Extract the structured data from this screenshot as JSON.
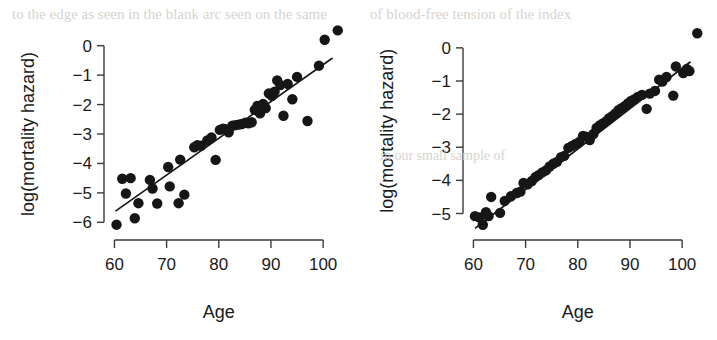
{
  "figure": {
    "background": "#ffffff",
    "ink_color": "#161616",
    "panel_count": 2
  },
  "ghost_artifacts": [
    {
      "text": "to the edge as seen in the blank arc seen on the same",
      "x": 12,
      "y": 6,
      "size": 15
    },
    {
      "text": "of blood-free tension of the index",
      "x": 370,
      "y": 6,
      "size": 15
    },
    {
      "text": "in our small sample of",
      "x": 380,
      "y": 148,
      "size": 14
    }
  ],
  "chart_data": [
    {
      "id": "left-panel",
      "type": "scatter",
      "title": "",
      "xlabel": "Age",
      "ylabel": "log(mortality hazard)",
      "xlim": [
        58,
        104
      ],
      "ylim": [
        -6.6,
        0.6
      ],
      "xticks": [
        60,
        70,
        80,
        90,
        100
      ],
      "xtick_labels": [
        "60",
        "70",
        "80",
        "90",
        "100"
      ],
      "yticks": [
        0,
        -1,
        -2,
        -3,
        -4,
        -5,
        -6
      ],
      "ytick_labels": [
        "0",
        "-1",
        "-2",
        "-3",
        "-4",
        "-5",
        "-6"
      ],
      "grid": false,
      "legend": "none",
      "marker": "filled-circle",
      "marker_size": 5.2,
      "fit_line": {
        "x_start": 60.2,
        "y_start": -5.62,
        "x_end": 101.8,
        "y_end": -0.42
      },
      "points": [
        [
          60.4,
          -6.08
        ],
        [
          61.5,
          -4.52
        ],
        [
          62.2,
          -5.02
        ],
        [
          63.1,
          -4.5
        ],
        [
          63.9,
          -5.86
        ],
        [
          64.6,
          -5.35
        ],
        [
          66.8,
          -4.56
        ],
        [
          67.3,
          -4.85
        ],
        [
          68.2,
          -5.36
        ],
        [
          70.3,
          -4.12
        ],
        [
          70.6,
          -4.78
        ],
        [
          72.3,
          -5.35
        ],
        [
          72.6,
          -3.87
        ],
        [
          73.4,
          -5.06
        ],
        [
          75.3,
          -3.45
        ],
        [
          75.9,
          -3.38
        ],
        [
          76.6,
          -3.4
        ],
        [
          77.8,
          -3.22
        ],
        [
          78.6,
          -3.12
        ],
        [
          79.4,
          -3.88
        ],
        [
          80.2,
          -2.86
        ],
        [
          80.8,
          -2.82
        ],
        [
          81.3,
          -2.84
        ],
        [
          81.9,
          -2.94
        ],
        [
          82.6,
          -2.72
        ],
        [
          83.2,
          -2.7
        ],
        [
          83.8,
          -2.68
        ],
        [
          84.4,
          -2.66
        ],
        [
          85.1,
          -2.62
        ],
        [
          85.7,
          -2.64
        ],
        [
          86.3,
          -2.6
        ],
        [
          86.9,
          -2.18
        ],
        [
          87.4,
          -2.05
        ],
        [
          87.9,
          -2.3
        ],
        [
          88.5,
          -1.98
        ],
        [
          89.0,
          -2.12
        ],
        [
          89.6,
          -1.62
        ],
        [
          90.2,
          -1.7
        ],
        [
          90.7,
          -1.56
        ],
        [
          91.2,
          -1.18
        ],
        [
          91.8,
          -1.34
        ],
        [
          92.4,
          -2.38
        ],
        [
          93.2,
          -1.3
        ],
        [
          94.1,
          -1.82
        ],
        [
          95.0,
          -1.06
        ],
        [
          97.0,
          -2.56
        ],
        [
          99.2,
          -0.68
        ],
        [
          100.3,
          0.2
        ],
        [
          102.8,
          0.52
        ]
      ]
    },
    {
      "id": "right-panel",
      "type": "scatter",
      "title": "",
      "xlabel": "Age",
      "ylabel": "log(mortality hazard)",
      "xlim": [
        58,
        104
      ],
      "ylim": [
        -5.8,
        0.6
      ],
      "xticks": [
        60,
        70,
        80,
        90,
        100
      ],
      "xtick_labels": [
        "60",
        "70",
        "80",
        "90",
        "100"
      ],
      "yticks": [
        0,
        -1,
        -2,
        -3,
        -4,
        -5
      ],
      "ytick_labels": [
        "0",
        "-1",
        "-2",
        "-3",
        "-4",
        "-5"
      ],
      "grid": false,
      "legend": "none",
      "marker": "filled-circle",
      "marker_size": 5.2,
      "fit_line": {
        "x_start": 60.3,
        "y_start": -5.45,
        "x_end": 101.6,
        "y_end": -0.42
      },
      "points": [
        [
          60.3,
          -5.08
        ],
        [
          61.2,
          -5.12
        ],
        [
          61.8,
          -5.34
        ],
        [
          62.4,
          -4.96
        ],
        [
          62.9,
          -5.08
        ],
        [
          63.4,
          -4.5
        ],
        [
          65.1,
          -4.98
        ],
        [
          66.0,
          -4.62
        ],
        [
          67.2,
          -4.48
        ],
        [
          68.3,
          -4.38
        ],
        [
          69.0,
          -4.34
        ],
        [
          69.6,
          -4.08
        ],
        [
          70.4,
          -4.12
        ],
        [
          71.2,
          -4.02
        ],
        [
          71.9,
          -3.9
        ],
        [
          72.5,
          -3.84
        ],
        [
          73.2,
          -3.76
        ],
        [
          73.9,
          -3.7
        ],
        [
          74.6,
          -3.58
        ],
        [
          75.3,
          -3.5
        ],
        [
          76.0,
          -3.44
        ],
        [
          76.8,
          -3.3
        ],
        [
          77.4,
          -3.26
        ],
        [
          78.2,
          -3.02
        ],
        [
          78.9,
          -2.96
        ],
        [
          79.6,
          -2.9
        ],
        [
          80.3,
          -2.84
        ],
        [
          81.0,
          -2.66
        ],
        [
          81.6,
          -2.68
        ],
        [
          82.3,
          -2.78
        ],
        [
          83.0,
          -2.6
        ],
        [
          83.6,
          -2.42
        ],
        [
          84.2,
          -2.34
        ],
        [
          84.8,
          -2.28
        ],
        [
          85.4,
          -2.22
        ],
        [
          86.0,
          -2.12
        ],
        [
          86.6,
          -2.06
        ],
        [
          87.2,
          -1.98
        ],
        [
          87.8,
          -1.88
        ],
        [
          88.4,
          -1.82
        ],
        [
          89.0,
          -1.76
        ],
        [
          89.6,
          -1.68
        ],
        [
          90.2,
          -1.6
        ],
        [
          90.8,
          -1.56
        ],
        [
          91.5,
          -1.48
        ],
        [
          92.3,
          -1.42
        ],
        [
          93.2,
          -1.84
        ],
        [
          93.8,
          -1.38
        ],
        [
          94.8,
          -1.3
        ],
        [
          95.6,
          -0.96
        ],
        [
          96.2,
          -1.02
        ],
        [
          97.0,
          -0.88
        ],
        [
          98.3,
          -1.44
        ],
        [
          98.8,
          -0.56
        ],
        [
          100.2,
          -0.76
        ],
        [
          100.9,
          -0.64
        ],
        [
          101.4,
          -0.7
        ],
        [
          102.9,
          0.44
        ]
      ]
    }
  ]
}
